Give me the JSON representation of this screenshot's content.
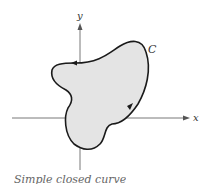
{
  "diagram": {
    "type": "simple closed curve in plane",
    "axes": {
      "x_label": "x",
      "y_label": "y"
    },
    "curve_label": "C",
    "curve_fill": "#e4e4e4",
    "curve_stroke": "#1a1a1a",
    "orientation": "counterclockwise",
    "caption": "Simple closed curve"
  }
}
